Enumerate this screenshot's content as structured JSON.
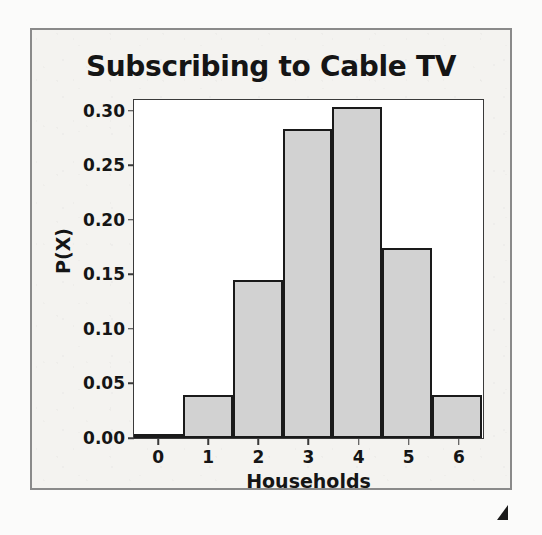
{
  "chart_data": {
    "type": "bar",
    "title": "Subscribing to Cable TV",
    "xlabel": "Households",
    "ylabel": "P(X)",
    "categories": [
      "0",
      "1",
      "2",
      "3",
      "4",
      "5",
      "6"
    ],
    "values": [
      0.004,
      0.039,
      0.145,
      0.283,
      0.304,
      0.174,
      0.039
    ],
    "ylim": [
      0.0,
      0.31
    ],
    "yticks": [
      "0.00",
      "0.05",
      "0.10",
      "0.15",
      "0.20",
      "0.25",
      "0.30"
    ],
    "ytick_values": [
      0.0,
      0.05,
      0.1,
      0.15,
      0.2,
      0.25,
      0.3
    ],
    "grid": false,
    "legend": null,
    "bar_fill_color": "#d2d2d2",
    "bar_edge_color": "#1a1a1a"
  },
  "figure": {
    "background_color": "#f4f3f0",
    "frame_color": "#8a8a8a",
    "plot_background_color": "#ffffff",
    "axis_color": "#3a3a3a",
    "text_color": "#151515"
  },
  "artifacts": {
    "scan_mark_name": "scan-artifact"
  }
}
